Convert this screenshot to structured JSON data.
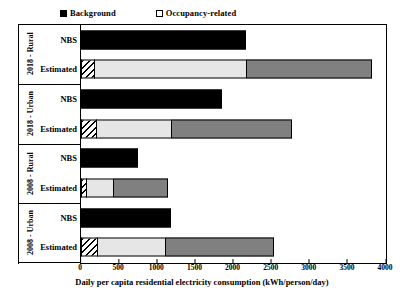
{
  "legend": {
    "items": [
      {
        "label": "Background",
        "swatch": "filled-black-square",
        "key": "background"
      },
      {
        "label": "Occupancy-related",
        "swatch": "empty-white-square",
        "key": "occupancy"
      }
    ]
  },
  "axis": {
    "x_label": "Daily per capita residential electricity consumption (kWh/person/day)",
    "x_ticks": [
      "0",
      "500",
      "1000",
      "1500",
      "2000",
      "2500",
      "3000",
      "3500",
      "4000"
    ],
    "x_min": 0,
    "x_max": 4000,
    "x_step": 500
  },
  "groups": [
    {
      "title": "2018 - Rural",
      "rows": [
        "NBS",
        "Estimated"
      ]
    },
    {
      "title": "2018 - Urban",
      "rows": [
        "NBS",
        "Estimated"
      ]
    },
    {
      "title": "2008 - Rural",
      "rows": [
        "NBS",
        "Estimated"
      ]
    },
    {
      "title": "2008 - Urban",
      "rows": [
        "NBS",
        "Estimated"
      ]
    }
  ],
  "colors": {
    "background_segment": "#000000",
    "hatched_segment": "#ffffff",
    "light_segment": "#e6e6e6",
    "dark_segment": "#808080",
    "frame": "#000000"
  },
  "chart_data": {
    "type": "bar",
    "orientation": "horizontal",
    "stacked": true,
    "title": "",
    "xlabel": "Daily per capita residential electricity consumption (kWh/person/day)",
    "ylabel": "",
    "xlim": [
      0,
      4000
    ],
    "xticks": [
      0,
      500,
      1000,
      1500,
      2000,
      2500,
      3000,
      3500,
      4000
    ],
    "grid": false,
    "legend_position": "top-left",
    "legend_entries": [
      "Background",
      "Occupancy-related"
    ],
    "categories": [
      "2018 - Rural / NBS",
      "2018 - Rural / Estimated",
      "2018 - Urban / NBS",
      "2018 - Urban / Estimated",
      "2008 - Rural / NBS",
      "2008 - Rural / Estimated",
      "2008 - Urban / NBS",
      "2008 - Urban / Estimated"
    ],
    "bars": [
      {
        "group": "2018 - Rural",
        "row": "NBS",
        "total": 2165,
        "segments": [
          {
            "style": "solid-black",
            "value": 2165
          }
        ]
      },
      {
        "group": "2018 - Rural",
        "row": "Estimated",
        "total": 3830,
        "segments": [
          {
            "style": "hatched",
            "value": 170
          },
          {
            "style": "light-gray",
            "value": 2000
          },
          {
            "style": "dark-gray",
            "value": 1660
          }
        ]
      },
      {
        "group": "2018 - Urban",
        "row": "NBS",
        "total": 1850,
        "segments": [
          {
            "style": "solid-black",
            "value": 1850
          }
        ]
      },
      {
        "group": "2018 - Urban",
        "row": "Estimated",
        "total": 2780,
        "segments": [
          {
            "style": "hatched",
            "value": 200
          },
          {
            "style": "light-gray",
            "value": 990
          },
          {
            "style": "dark-gray",
            "value": 1590
          }
        ]
      },
      {
        "group": "2008 - Rural",
        "row": "NBS",
        "total": 750,
        "segments": [
          {
            "style": "solid-black",
            "value": 750
          }
        ]
      },
      {
        "group": "2008 - Rural",
        "row": "Estimated",
        "total": 1150,
        "segments": [
          {
            "style": "hatched",
            "value": 70
          },
          {
            "style": "light-gray",
            "value": 350
          },
          {
            "style": "dark-gray",
            "value": 730
          }
        ]
      },
      {
        "group": "2008 - Urban",
        "row": "NBS",
        "total": 1180,
        "segments": [
          {
            "style": "solid-black",
            "value": 1180
          }
        ]
      },
      {
        "group": "2008 - Urban",
        "row": "Estimated",
        "total": 2545,
        "segments": [
          {
            "style": "hatched",
            "value": 210
          },
          {
            "style": "light-gray",
            "value": 900
          },
          {
            "style": "dark-gray",
            "value": 1430
          }
        ]
      }
    ]
  }
}
